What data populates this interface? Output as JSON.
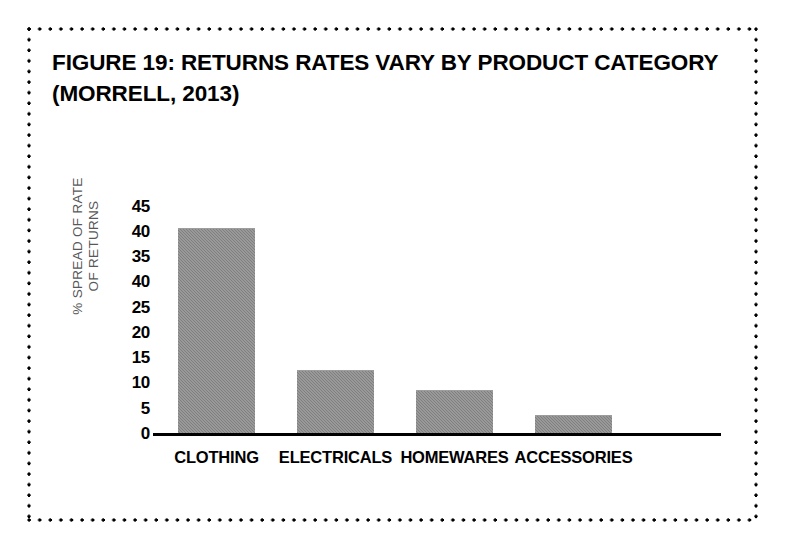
{
  "figure": {
    "title_line_1": "FIGURE 19: RETURNS RATES VARY BY PRODUCT CATEGORY",
    "title_line_2": "(MORRELL, 2013)",
    "border_style": "dotted",
    "border_color": "#000000",
    "background_color": "#ffffff"
  },
  "chart_data": {
    "type": "bar",
    "title": "FIGURE 19: RETURNS RATES VARY BY PRODUCT CATEGORY (MORRELL, 2013)",
    "categories": [
      "CLOTHING",
      "ELECTRICALS",
      "HOMEWARES",
      "ACCESSORIES"
    ],
    "values": [
      40.5,
      12.5,
      8.5,
      3.5
    ],
    "xlabel": "",
    "ylabel_line_1": "% SPREAD OF RATE",
    "ylabel_line_2": "OF RETURNS",
    "ylim": [
      0,
      45
    ],
    "ytick_labels": [
      "45",
      "40",
      "35",
      "40",
      "25",
      "20",
      "15",
      "10",
      "5",
      "0"
    ],
    "ytick_values": [
      45,
      40,
      35,
      30,
      25,
      20,
      15,
      10,
      5,
      0
    ],
    "grid": false,
    "legend": false,
    "bar_color": "#8a8a8a",
    "axis_color": "#000000",
    "ylabel_color": "#58585a"
  }
}
